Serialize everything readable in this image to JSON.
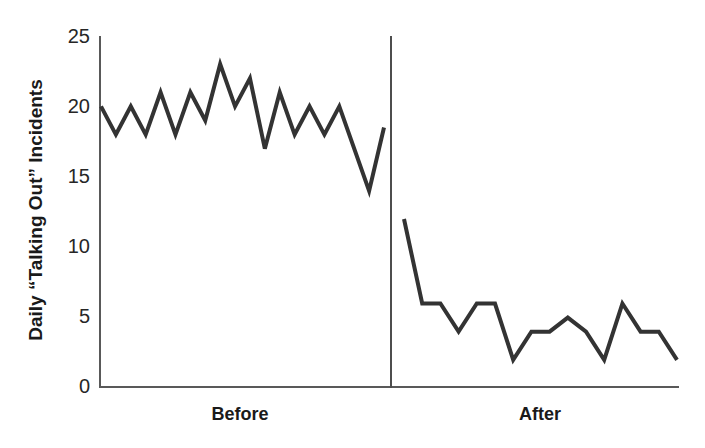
{
  "chart_data": {
    "type": "line",
    "title": "",
    "xlabel": "",
    "ylabel": "Daily “Talking Out” Incidents",
    "ylim": [
      0,
      25
    ],
    "yticks": [
      0,
      5,
      10,
      15,
      20,
      25
    ],
    "ytick_labels": [
      "0",
      "5",
      "10",
      "15",
      "20",
      "25"
    ],
    "grid": false,
    "legend": "none",
    "phases": [
      {
        "name": "Before",
        "label": "Before",
        "values": [
          20,
          18,
          20,
          18,
          21,
          18,
          21,
          19,
          23,
          20,
          22,
          17,
          21,
          18,
          20,
          18,
          20,
          17,
          14,
          18.5
        ]
      },
      {
        "name": "After",
        "label": "After",
        "values": [
          12,
          6,
          6,
          4,
          6,
          6,
          2,
          4,
          4,
          5,
          4,
          2,
          6,
          4,
          4,
          2
        ]
      }
    ],
    "series": [
      {
        "name": "Daily “Talking Out” Incidents",
        "color": "#333333",
        "values": [
          20,
          18,
          20,
          18,
          21,
          18,
          21,
          19,
          23,
          20,
          22,
          17,
          21,
          18,
          20,
          18,
          20,
          17,
          14,
          18.5,
          12,
          6,
          6,
          4,
          6,
          6,
          2,
          4,
          4,
          5,
          4,
          2,
          6,
          4,
          4,
          2
        ]
      }
    ],
    "phase_divider": true
  },
  "axis": {
    "y_title": "Daily “Talking Out” Incidents",
    "tick_labels": [
      "25",
      "20",
      "15",
      "10",
      "5",
      "0"
    ]
  },
  "colors": {
    "line": "#333333",
    "axis": "#595959",
    "divider": "#4d4d4d",
    "text": "#1a1a1a",
    "background": "#ffffff"
  }
}
